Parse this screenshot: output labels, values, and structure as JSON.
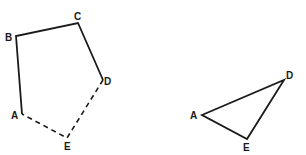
{
  "figures": {
    "pentagon": {
      "labels": {
        "A": "A",
        "B": "B",
        "C": "C",
        "D": "D",
        "E": "E"
      },
      "solid_edges": [
        "A-B",
        "B-C",
        "C-D"
      ],
      "dashed_edges": [
        "D-E",
        "E-A"
      ]
    },
    "triangle": {
      "labels": {
        "A": "A",
        "D": "D",
        "E": "E"
      },
      "solid_edges": [
        "A-D",
        "D-E",
        "E-A"
      ]
    }
  },
  "colors": {
    "stroke": "#1a1a1a",
    "background": "#ffffff"
  }
}
